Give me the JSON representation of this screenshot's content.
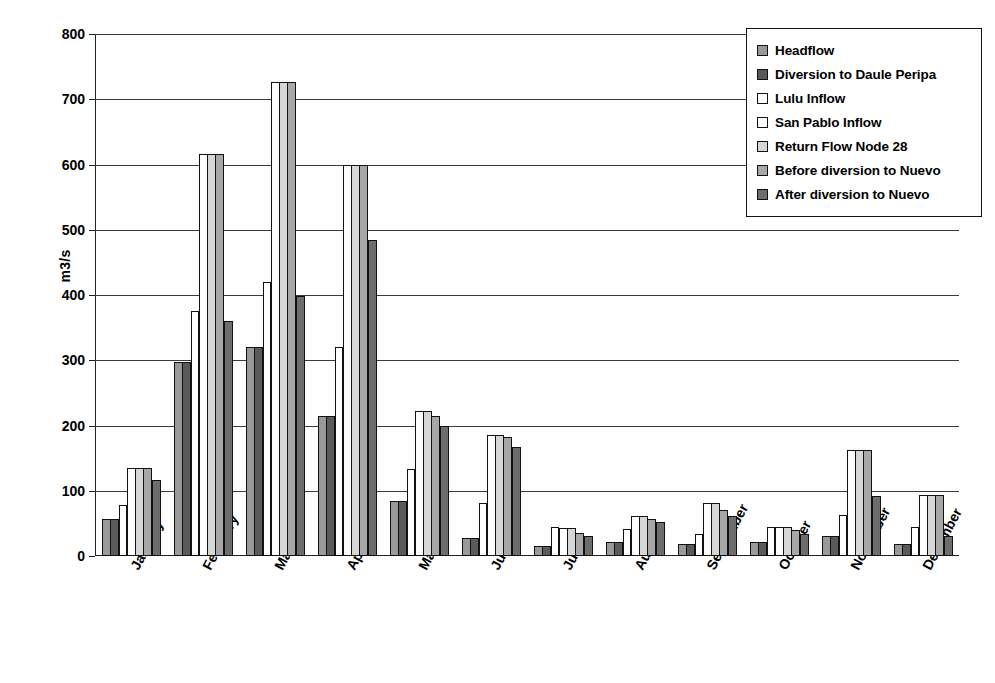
{
  "chart_data": {
    "type": "bar",
    "title": "",
    "subtitle": "",
    "xlabel": "",
    "ylabel": "m3/s",
    "ylim": [
      0,
      800
    ],
    "ytick_labels": [
      "800",
      "700",
      "600",
      "500",
      "400",
      "300",
      "200",
      "100",
      "0"
    ],
    "ytick_values": [
      800,
      700,
      600,
      500,
      400,
      300,
      200,
      100,
      0
    ],
    "grid": true,
    "legend_position": "top-right",
    "categories": [
      "January",
      "February",
      "March",
      "April",
      "May",
      "June",
      "July",
      "August",
      "September",
      "October",
      "November",
      "December"
    ],
    "series": [
      {
        "name": "Headflow",
        "color": "#999999",
        "values": [
          57,
          297,
          320,
          215,
          84,
          27,
          16,
          22,
          19,
          21,
          30,
          19
        ]
      },
      {
        "name": "Diversion to Daule Peripa",
        "color": "#5a5a5a",
        "values": [
          57,
          297,
          320,
          215,
          84,
          27,
          16,
          22,
          19,
          21,
          30,
          19
        ]
      },
      {
        "name": "Lulu Inflow",
        "color": "#ffffff",
        "values": [
          78,
          375,
          420,
          320,
          133,
          82,
          44,
          42,
          34,
          45,
          63,
          45
        ]
      },
      {
        "name": "San Pablo Inflow",
        "color": "#ffffff",
        "values": [
          135,
          616,
          726,
          600,
          222,
          186,
          43,
          62,
          82,
          45,
          162,
          93
        ]
      },
      {
        "name": "Return Flow Node 28",
        "color": "#d6d6d6",
        "values": [
          135,
          616,
          726,
          600,
          222,
          186,
          43,
          62,
          82,
          45,
          162,
          93
        ]
      },
      {
        "name": "Before diversion to Nuevo",
        "color": "#a8a8a8",
        "values": [
          135,
          616,
          726,
          600,
          215,
          183,
          35,
          57,
          70,
          40,
          162,
          93
        ]
      },
      {
        "name": "After diversion to Nuevo",
        "color": "#6e6e6e",
        "values": [
          117,
          360,
          398,
          485,
          200,
          167,
          31,
          52,
          61,
          33,
          92,
          31
        ]
      }
    ]
  },
  "legend": {
    "items": [
      {
        "label": "Headflow"
      },
      {
        "label": "Diversion to Daule Peripa"
      },
      {
        "label": "Lulu Inflow"
      },
      {
        "label": "San Pablo Inflow"
      },
      {
        "label": "Return Flow Node 28"
      },
      {
        "label": "Before diversion to Nuevo"
      },
      {
        "label": "After diversion to Nuevo"
      }
    ]
  }
}
